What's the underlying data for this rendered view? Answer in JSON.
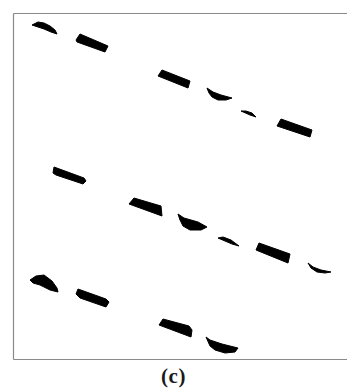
{
  "figure": {
    "caption": "(c)",
    "frame": {
      "left": 13,
      "top": 13,
      "right": 347,
      "bottom": 359,
      "stroke": "#8a8a8a",
      "show_right": false
    },
    "ink_color": "#000000",
    "background": "#ffffff",
    "rows": [
      {
        "name": "row-1",
        "segments": [
          {
            "kind": "dome",
            "points": "32,25 38,22 44,23 50,26 55,30 57,34 51,32 44,29 38,27"
          },
          {
            "kind": "bar",
            "points": "76,40 80,34 108,46 105,52 77,42"
          },
          {
            "kind": "bar",
            "points": "158,76 162,70 190,81 188,88"
          },
          {
            "kind": "dome",
            "points": "207,88 213,92 221,95 232,98 226,100 218,100 212,97 209,93"
          },
          {
            "kind": "sliver",
            "points": "241,111 246,111 252,113 256,117 250,115"
          },
          {
            "kind": "bar",
            "points": "277,126 281,119 312,130 310,137"
          }
        ]
      },
      {
        "name": "row-2",
        "segments": [
          {
            "kind": "bar",
            "points": "53,173 54,167 84,178 86,181 83,184 56,175"
          },
          {
            "kind": "bar",
            "points": "129,204 134,198 161,206 162,216"
          },
          {
            "kind": "dome",
            "points": "178,214 184,218 198,222 207,227 201,230 190,230 183,226 180,220"
          },
          {
            "kind": "sliver",
            "points": "218,238 223,237 231,240 239,246 232,244"
          },
          {
            "kind": "bar",
            "points": "256,250 259,243 290,254 288,263"
          },
          {
            "kind": "dome",
            "points": "308,263 313,267 321,270 331,272 325,273 317,272 311,268"
          }
        ]
      },
      {
        "name": "row-3",
        "segments": [
          {
            "kind": "dome",
            "points": "30,280 36,276 44,275 52,281 57,288 58,292 50,290 40,285 33,283"
          },
          {
            "kind": "bar",
            "points": "76,294 78,289 106,299 109,302 106,307 80,298"
          },
          {
            "kind": "bar",
            "points": "159,325 163,319 189,326 192,330 191,337"
          },
          {
            "kind": "dome",
            "points": "206,337 210,340 222,344 238,348 235,352 225,353 215,350 210,346"
          }
        ]
      }
    ]
  }
}
